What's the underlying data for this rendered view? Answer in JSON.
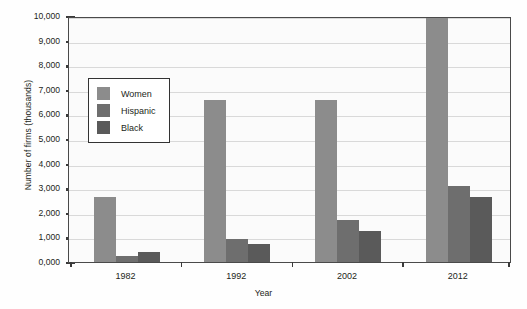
{
  "chart_data": {
    "type": "bar",
    "title": "",
    "xlabel": "Year",
    "ylabel": "Number of firms (thousands)",
    "categories": [
      "1982",
      "1992",
      "2002",
      "2012"
    ],
    "series": [
      {
        "name": "Women",
        "color": "#8c8c8c",
        "values": [
          2650,
          6600,
          6600,
          10300
        ]
      },
      {
        "name": "Hispanic",
        "color": "#6e6e6e",
        "values": [
          250,
          950,
          1700,
          3100
        ]
      },
      {
        "name": "Black",
        "color": "#5a5a5a",
        "values": [
          400,
          750,
          1250,
          2650
        ]
      }
    ],
    "ylim": [
      0,
      10000
    ],
    "ytick_labels": [
      "10,000",
      "9,000",
      "8,000",
      "7,000",
      "6,000",
      "5,000",
      "4,000",
      "3,000",
      "2,000",
      "1,000",
      "0,000"
    ],
    "ytick_values": [
      10000,
      9000,
      8000,
      7000,
      6000,
      5000,
      4000,
      3000,
      2000,
      1000,
      0
    ],
    "grid": true,
    "legend_position": "inside-upper-left",
    "legend_entries": [
      "Women",
      "Hispanic",
      "Black"
    ]
  }
}
